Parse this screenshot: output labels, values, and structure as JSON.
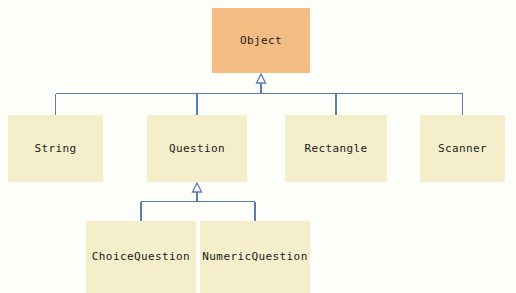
{
  "diagram": {
    "type": "uml-class-hierarchy",
    "title": "",
    "background_color": "#fdfdfa",
    "line_color": "#5b7cb0",
    "root_fill": "#f3bd83",
    "subclass_fill": "#f5eecb",
    "text_color": "#1a1a1a",
    "arrowhead": "hollow-triangle-inheritance",
    "nodes": [
      {
        "id": "object",
        "label": "Object",
        "kind": "root",
        "x": 212,
        "y": 8,
        "w": 98,
        "h": 65
      },
      {
        "id": "string",
        "label": "String",
        "kind": "sub",
        "x": 8,
        "y": 115,
        "w": 95,
        "h": 67
      },
      {
        "id": "question",
        "label": "Question",
        "kind": "sub",
        "x": 147,
        "y": 115,
        "w": 100,
        "h": 67
      },
      {
        "id": "rectangle",
        "label": "Rectangle",
        "kind": "sub",
        "x": 285,
        "y": 115,
        "w": 102,
        "h": 67
      },
      {
        "id": "scanner",
        "label": "Scanner",
        "kind": "sub",
        "x": 420,
        "y": 115,
        "w": 85,
        "h": 67
      },
      {
        "id": "choicequestion",
        "label": "ChoiceQuestion",
        "kind": "sub",
        "x": 86,
        "y": 221,
        "w": 110,
        "h": 72
      },
      {
        "id": "numericquestion",
        "label": "NumericQuestion",
        "kind": "sub",
        "x": 200,
        "y": 221,
        "w": 110,
        "h": 72
      }
    ],
    "edges": [
      {
        "from": "string",
        "to": "object",
        "relation": "inheritance"
      },
      {
        "from": "question",
        "to": "object",
        "relation": "inheritance"
      },
      {
        "from": "rectangle",
        "to": "object",
        "relation": "inheritance"
      },
      {
        "from": "scanner",
        "to": "object",
        "relation": "inheritance"
      },
      {
        "from": "choicequestion",
        "to": "question",
        "relation": "inheritance"
      },
      {
        "from": "numericquestion",
        "to": "question",
        "relation": "inheritance"
      }
    ]
  }
}
